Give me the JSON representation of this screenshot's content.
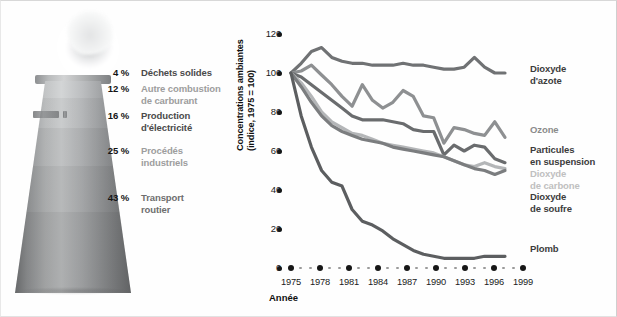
{
  "sources": {
    "items": [
      {
        "pct": "4 %",
        "label": "Déchets solides",
        "color": "#4a4a4a",
        "top": 0
      },
      {
        "pct": "12 %",
        "label": "Autre combustion\nde carburant",
        "color": "#9d9d9d",
        "top": 16
      },
      {
        "pct": "16 %",
        "label": "Production\nd'électricité",
        "color": "#4a4a4a",
        "top": 43
      },
      {
        "pct": "25 %",
        "label": "Procédés\nindustriels",
        "color": "#9d9d9d",
        "top": 78
      },
      {
        "pct": "43 %",
        "label": "Transport\nroutier",
        "color": "#6e6e6e",
        "top": 125
      }
    ]
  },
  "chart_data": {
    "type": "line",
    "title": "",
    "xlabel": "Année",
    "ylabel": "Concentrations ambiantes\n(indice, 1975 = 100)",
    "ylim": [
      0,
      120
    ],
    "yticks": [
      0,
      20,
      40,
      60,
      80,
      100,
      120
    ],
    "xlim": [
      1975,
      1999
    ],
    "xticks": [
      1975,
      1978,
      1981,
      1984,
      1987,
      1990,
      1993,
      1996,
      1999
    ],
    "x": [
      1975,
      1976,
      1977,
      1978,
      1979,
      1980,
      1981,
      1982,
      1983,
      1984,
      1985,
      1986,
      1987,
      1988,
      1989,
      1990,
      1991,
      1992,
      1993,
      1994,
      1995,
      1996
    ],
    "grid": false,
    "legend_position": "right-of-plot",
    "series": [
      {
        "name": "Dioxyde\nd'azote",
        "color": "#707274",
        "label_color": "#3c3c3c",
        "label_top": 62,
        "values": [
          100,
          105,
          111,
          113,
          108,
          106,
          105,
          105,
          104,
          104,
          104,
          105,
          104,
          104,
          103,
          102,
          102,
          103,
          108,
          103,
          100,
          100
        ]
      },
      {
        "name": "Ozone",
        "color": "#8e9092",
        "label_color": "#8b8b8b",
        "label_top": 123,
        "values": [
          100,
          101,
          104,
          99,
          94,
          88,
          83,
          94,
          86,
          82,
          85,
          91,
          88,
          78,
          77,
          64,
          72,
          71,
          69,
          68,
          75,
          67
        ]
      },
      {
        "name": "Particules\nen suspension",
        "color": "#6a6c6e",
        "label_color": "#3c3c3c",
        "label_top": 143,
        "values": [
          100,
          98,
          94,
          90,
          86,
          82,
          78,
          76,
          76,
          76,
          75,
          74,
          71,
          70,
          70,
          58,
          63,
          60,
          63,
          62,
          56,
          54
        ]
      },
      {
        "name": "Dioxyde\nde carbone",
        "color": "#b4b6b8",
        "label_color": "#c0c0c0",
        "label_top": 167,
        "values": [
          100,
          95,
          88,
          80,
          75,
          72,
          69,
          68,
          66,
          64,
          63,
          62,
          61,
          60,
          59,
          57,
          55,
          53,
          52,
          54,
          52,
          51
        ]
      },
      {
        "name": "Dioxyde\nde soufre",
        "color": "#7b7d7f",
        "label_color": "#3c3c3c",
        "label_top": 190,
        "values": [
          100,
          93,
          85,
          78,
          73,
          70,
          68,
          66,
          65,
          64,
          62,
          61,
          60,
          59,
          58,
          57,
          55,
          53,
          51,
          50,
          48,
          50
        ]
      },
      {
        "name": "Plomb",
        "color": "#5c5e60",
        "label_color": "#3c3c3c",
        "label_top": 242,
        "values": [
          100,
          78,
          62,
          50,
          44,
          42,
          30,
          24,
          22,
          19,
          15,
          12,
          9,
          7,
          6,
          5,
          5,
          5,
          5,
          6,
          6,
          6
        ]
      }
    ]
  }
}
